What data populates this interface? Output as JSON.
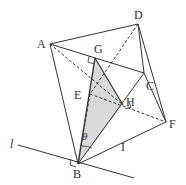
{
  "diagram": {
    "type": "solid-geometry",
    "labels": {
      "A": "A",
      "B": "B",
      "C": "C",
      "D": "D",
      "E": "E",
      "F": "F",
      "G": "G",
      "H": "H",
      "l": "l",
      "I": "I",
      "theta": "θ"
    },
    "points": {
      "A": [
        50,
        44
      ],
      "B": [
        78,
        164
      ],
      "C": [
        144,
        73
      ],
      "D": [
        138,
        24
      ],
      "E": [
        90,
        94
      ],
      "F": [
        166,
        122
      ],
      "G": [
        95,
        58
      ],
      "H": [
        123,
        105
      ]
    },
    "line_l": [
      [
        18,
        145
      ],
      [
        134,
        178
      ]
    ],
    "shaded_region": [
      "G",
      "H",
      "B"
    ],
    "colors": {
      "stroke": "#333333",
      "shade": "#d9d9d9"
    }
  }
}
